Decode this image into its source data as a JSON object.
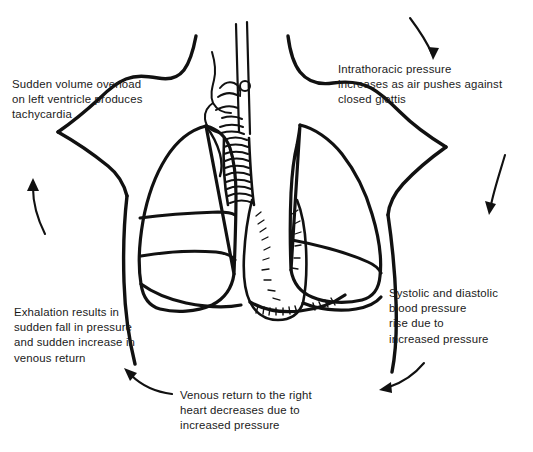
{
  "figure": {
    "background_color": "#ffffff",
    "ink_color": "#111111",
    "text_color": "#1a1a1a",
    "width": 533,
    "height": 452
  },
  "illustration": {
    "subject": "anterior view of human thorax",
    "parts": [
      "neck-and-shoulders-outline",
      "larynx",
      "trachea",
      "right-lung",
      "left-lung",
      "mediastinum",
      "diaphragm",
      "torso-sides"
    ]
  },
  "captions": {
    "tachycardia": "Sudden volume overload\non left ventricle produces\ntachycardia",
    "intrathoracic": "Intrathoracic pressure\nincreases as air pushes against\nclosed glottis",
    "systolic": "Systolic and diastolic\nblood pressure\nrise due to\nincreased pressure",
    "exhalation": "Exhalation results in\nsudden fall in pressure\nand sudden increase in\nvenous return",
    "venous": "Venous return to the right\nheart decreases due to\nincreased pressure"
  },
  "flow_arrows": [
    {
      "name": "arrow-top-right",
      "direction": "down-right",
      "position": "top right"
    },
    {
      "name": "arrow-right",
      "direction": "down",
      "position": "right middle"
    },
    {
      "name": "arrow-bottom-right",
      "direction": "left",
      "position": "bottom right"
    },
    {
      "name": "arrow-bottom-left",
      "direction": "up-left",
      "position": "bottom left"
    },
    {
      "name": "arrow-left",
      "direction": "up",
      "position": "left middle"
    }
  ],
  "cycle_order": [
    "intrathoracic",
    "systolic",
    "venous",
    "exhalation",
    "tachycardia"
  ]
}
